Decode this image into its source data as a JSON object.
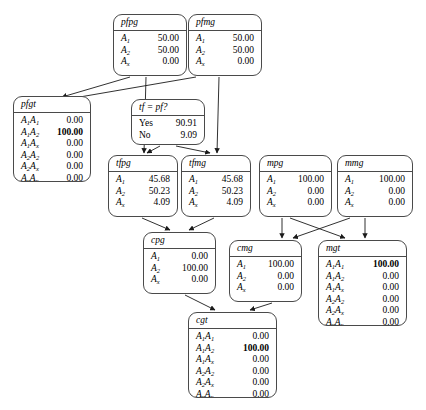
{
  "diagram": {
    "nodes": [
      {
        "id": "pfpg",
        "name": "pfpg",
        "rows": [
          {
            "label": "A",
            "sub": "1",
            "value": "50.00",
            "bold": false
          },
          {
            "label": "A",
            "sub": "2",
            "value": "50.00",
            "bold": false
          },
          {
            "label": "A",
            "sub": "x",
            "value": "0.00",
            "bold": false
          }
        ]
      },
      {
        "id": "pfmg",
        "name": "pfmg",
        "rows": [
          {
            "label": "A",
            "sub": "1",
            "value": "50.00",
            "bold": false
          },
          {
            "label": "A",
            "sub": "2",
            "value": "50.00",
            "bold": false
          },
          {
            "label": "A",
            "sub": "x",
            "value": "0.00",
            "bold": false
          }
        ]
      },
      {
        "id": "pfgt",
        "name": "pfgt",
        "rows": [
          {
            "label": "A",
            "sub": "1",
            "label2": "A",
            "sub2": "1",
            "value": "0.00",
            "bold": false
          },
          {
            "label": "A",
            "sub": "1",
            "label2": "A",
            "sub2": "2",
            "value": "100.00",
            "bold": true
          },
          {
            "label": "A",
            "sub": "1",
            "label2": "A",
            "sub2": "x",
            "value": "0.00",
            "bold": false
          },
          {
            "label": "A",
            "sub": "2",
            "label2": "A",
            "sub2": "2",
            "value": "0.00",
            "bold": false
          },
          {
            "label": "A",
            "sub": "2",
            "label2": "A",
            "sub2": "x",
            "value": "0.00",
            "bold": false
          },
          {
            "label": "A",
            "sub": "x",
            "label2": "A",
            "sub2": "x",
            "value": "0.00",
            "bold": false
          }
        ]
      },
      {
        "id": "tfpf",
        "name": "tf = pf?",
        "rows": [
          {
            "label": "Yes",
            "value": "90.91",
            "bold": false,
            "plain": true
          },
          {
            "label": "No",
            "value": "9.09",
            "bold": false,
            "plain": true
          }
        ]
      },
      {
        "id": "tfpg",
        "name": "tfpg",
        "rows": [
          {
            "label": "A",
            "sub": "1",
            "value": "45.68",
            "bold": false
          },
          {
            "label": "A",
            "sub": "2",
            "value": "50.23",
            "bold": false
          },
          {
            "label": "A",
            "sub": "x",
            "value": "4.09",
            "bold": false
          }
        ]
      },
      {
        "id": "tfmg",
        "name": "tfmg",
        "rows": [
          {
            "label": "A",
            "sub": "1",
            "value": "45.68",
            "bold": false
          },
          {
            "label": "A",
            "sub": "2",
            "value": "50.23",
            "bold": false
          },
          {
            "label": "A",
            "sub": "x",
            "value": "4.09",
            "bold": false
          }
        ]
      },
      {
        "id": "mpg",
        "name": "mpg",
        "rows": [
          {
            "label": "A",
            "sub": "1",
            "value": "100.00",
            "bold": false
          },
          {
            "label": "A",
            "sub": "2",
            "value": "0.00",
            "bold": false
          },
          {
            "label": "A",
            "sub": "x",
            "value": "0.00",
            "bold": false
          }
        ]
      },
      {
        "id": "mmg",
        "name": "mmg",
        "rows": [
          {
            "label": "A",
            "sub": "1",
            "value": "100.00",
            "bold": false
          },
          {
            "label": "A",
            "sub": "2",
            "value": "0.00",
            "bold": false
          },
          {
            "label": "A",
            "sub": "x",
            "value": "0.00",
            "bold": false
          }
        ]
      },
      {
        "id": "cpg",
        "name": "cpg",
        "rows": [
          {
            "label": "A",
            "sub": "1",
            "value": "0.00",
            "bold": false
          },
          {
            "label": "A",
            "sub": "2",
            "value": "100.00",
            "bold": false
          },
          {
            "label": "A",
            "sub": "x",
            "value": "0.00",
            "bold": false
          }
        ]
      },
      {
        "id": "cmg",
        "name": "cmg",
        "rows": [
          {
            "label": "A",
            "sub": "1",
            "value": "100.00",
            "bold": false
          },
          {
            "label": "A",
            "sub": "2",
            "value": "0.00",
            "bold": false
          },
          {
            "label": "A",
            "sub": "x",
            "value": "0.00",
            "bold": false
          }
        ]
      },
      {
        "id": "mgt",
        "name": "mgt",
        "rows": [
          {
            "label": "A",
            "sub": "1",
            "label2": "A",
            "sub2": "1",
            "value": "100.00",
            "bold": true
          },
          {
            "label": "A",
            "sub": "1",
            "label2": "A",
            "sub2": "2",
            "value": "0.00",
            "bold": false
          },
          {
            "label": "A",
            "sub": "1",
            "label2": "A",
            "sub2": "x",
            "value": "0.00",
            "bold": false
          },
          {
            "label": "A",
            "sub": "2",
            "label2": "A",
            "sub2": "2",
            "value": "0.00",
            "bold": false
          },
          {
            "label": "A",
            "sub": "2",
            "label2": "A",
            "sub2": "x",
            "value": "0.00",
            "bold": false
          },
          {
            "label": "A",
            "sub": "x",
            "label2": "A",
            "sub2": "x",
            "value": "0.00",
            "bold": false
          }
        ]
      },
      {
        "id": "cgt",
        "name": "cgt",
        "rows": [
          {
            "label": "A",
            "sub": "1",
            "label2": "A",
            "sub2": "1",
            "value": "0.00",
            "bold": false
          },
          {
            "label": "A",
            "sub": "1",
            "label2": "A",
            "sub2": "2",
            "value": "100.00",
            "bold": true
          },
          {
            "label": "A",
            "sub": "1",
            "label2": "A",
            "sub2": "x",
            "value": "0.00",
            "bold": false
          },
          {
            "label": "A",
            "sub": "2",
            "label2": "A",
            "sub2": "2",
            "value": "0.00",
            "bold": false
          },
          {
            "label": "A",
            "sub": "2",
            "label2": "A",
            "sub2": "x",
            "value": "0.00",
            "bold": false
          },
          {
            "label": "A",
            "sub": "x",
            "label2": "A",
            "sub2": "x",
            "value": "0.00",
            "bold": false
          }
        ]
      }
    ],
    "edges": [
      {
        "from": "pfpg",
        "to": "pfgt"
      },
      {
        "from": "pfmg",
        "to": "pfgt"
      },
      {
        "from": "pfpg",
        "to": "tfpg"
      },
      {
        "from": "pfmg",
        "to": "tfmg"
      },
      {
        "from": "tfpf",
        "to": "tfpg"
      },
      {
        "from": "tfpf",
        "to": "tfmg"
      },
      {
        "from": "tfpg",
        "to": "cpg"
      },
      {
        "from": "tfmg",
        "to": "cpg"
      },
      {
        "from": "mpg",
        "to": "cmg"
      },
      {
        "from": "mpg",
        "to": "mgt"
      },
      {
        "from": "mmg",
        "to": "cmg"
      },
      {
        "from": "mmg",
        "to": "mgt"
      },
      {
        "from": "cpg",
        "to": "cgt"
      },
      {
        "from": "cmg",
        "to": "cgt"
      }
    ],
    "colors": {
      "node_border": "#4a4a4a",
      "edge": "#1a1a1a",
      "background": "#ffffff"
    }
  }
}
